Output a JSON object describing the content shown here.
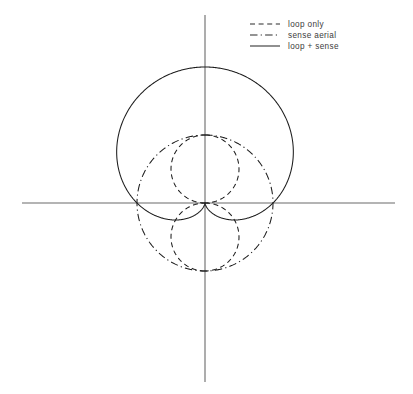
{
  "figure": {
    "title": "",
    "origin": {
      "x": 205,
      "y": 203
    },
    "scale_px_per_unit": 68,
    "axes": {
      "horizontal": {
        "x1": 22,
        "y1": 203,
        "x2": 395,
        "y2": 203,
        "color": "#6a6a6a"
      },
      "vertical": {
        "x1": 205,
        "y1": 15,
        "x2": 205,
        "y2": 382,
        "color": "#6a6a6a"
      }
    }
  },
  "legend": {
    "position": "top-right",
    "x": 250,
    "y": 24,
    "row_height": 11,
    "sample_length": 30,
    "label_offset": 38,
    "items": [
      {
        "label": "loop only",
        "style": "dashed",
        "dash": "5 3.6",
        "color": "#2b2b2b"
      },
      {
        "label": "sense aerial",
        "style": "dash-dot",
        "dash": "7.5 3.2 1.2 3.2",
        "color": "#2b2b2b"
      },
      {
        "label": "loop + sense",
        "style": "solid",
        "dash": "none",
        "color": "#2b2b2b"
      }
    ]
  },
  "chart_data": {
    "type": "line",
    "subtype": "polar-radiation-pattern",
    "title": "",
    "xlabel": "",
    "ylabel": "",
    "theta_units": "degrees",
    "theta_range": [
      0,
      360
    ],
    "r_max": 2,
    "grid": false,
    "orientation_note": "theta measured from the upward vertical axis, increasing clockwise",
    "legend_position": "top-right",
    "series": [
      {
        "name": "loop only",
        "style": "dashed",
        "formula": "r = |cos(theta)|",
        "peak_r": 1,
        "lobes": 2,
        "nulls_deg": [
          90,
          270
        ],
        "maxima_deg": [
          0,
          180
        ],
        "theta_deg": [
          0,
          15,
          30,
          45,
          60,
          75,
          90,
          105,
          120,
          135,
          150,
          165,
          180,
          195,
          210,
          225,
          240,
          255,
          270,
          285,
          300,
          315,
          330,
          345,
          360
        ],
        "r": [
          1,
          0.966,
          0.866,
          0.707,
          0.5,
          0.259,
          0,
          0.259,
          0.5,
          0.707,
          0.866,
          0.966,
          1,
          0.966,
          0.866,
          0.707,
          0.5,
          0.259,
          0,
          0.259,
          0.5,
          0.707,
          0.866,
          0.966,
          1
        ]
      },
      {
        "name": "sense aerial",
        "style": "dash-dot",
        "formula": "r = 1",
        "peak_r": 1,
        "lobes": 1,
        "nulls_deg": [],
        "maxima_deg": [
          0,
          90,
          180,
          270
        ],
        "theta_deg": [
          0,
          15,
          30,
          45,
          60,
          75,
          90,
          105,
          120,
          135,
          150,
          165,
          180,
          195,
          210,
          225,
          240,
          255,
          270,
          285,
          300,
          315,
          330,
          345,
          360
        ],
        "r": [
          1,
          1,
          1,
          1,
          1,
          1,
          1,
          1,
          1,
          1,
          1,
          1,
          1,
          1,
          1,
          1,
          1,
          1,
          1,
          1,
          1,
          1,
          1,
          1,
          1
        ]
      },
      {
        "name": "loop + sense",
        "style": "solid",
        "formula": "r = 1 + cos(theta)",
        "peak_r": 2,
        "lobes": 1,
        "nulls_deg": [
          0
        ],
        "maxima_deg": [
          180
        ],
        "theta_deg": [
          0,
          15,
          30,
          45,
          60,
          75,
          90,
          105,
          120,
          135,
          150,
          165,
          180,
          195,
          210,
          225,
          240,
          255,
          270,
          285,
          300,
          315,
          330,
          345,
          360
        ],
        "r": [
          0,
          0.034,
          0.134,
          0.293,
          0.5,
          0.741,
          1,
          1.259,
          1.5,
          1.707,
          1.866,
          1.966,
          2,
          1.966,
          1.866,
          1.707,
          1.5,
          1.259,
          1,
          0.741,
          0.5,
          0.293,
          0.134,
          0.034,
          0
        ]
      }
    ]
  }
}
